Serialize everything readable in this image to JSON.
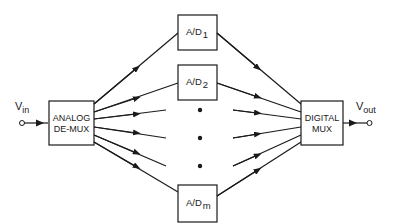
{
  "diagram": {
    "type": "block-diagram",
    "input": {
      "label": "V",
      "subscript": "in"
    },
    "output": {
      "label": "V",
      "subscript": "out"
    },
    "demux": {
      "line1": "ANALOG",
      "line2": "DE-MUX"
    },
    "mux": {
      "line1": "DIGITAL",
      "line2": "MUX"
    },
    "converters": [
      {
        "label": "A/D",
        "subscript": "1"
      },
      {
        "label": "A/D",
        "subscript": "2"
      },
      {
        "label": "A/D",
        "subscript": "m"
      }
    ],
    "ellipsis": "•",
    "colors": {
      "stroke": "#1a1a1a",
      "background": "#ffffff"
    }
  }
}
